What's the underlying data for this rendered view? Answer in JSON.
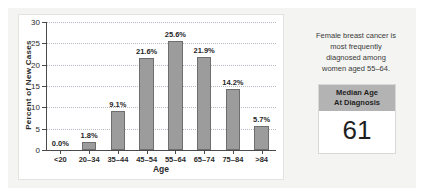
{
  "chart_data": {
    "type": "bar",
    "title": "",
    "xlabel": "Age",
    "ylabel": "Percent of New Cases",
    "categories": [
      "<20",
      "20–34",
      "35–44",
      "45–54",
      "55–64",
      "65–74",
      "75–84",
      ">84"
    ],
    "values": [
      0.0,
      1.8,
      9.1,
      21.6,
      25.6,
      21.9,
      14.2,
      5.7
    ],
    "value_labels": [
      "0.0%",
      "1.8%",
      "9.1%",
      "21.6%",
      "25.6%",
      "21.9%",
      "14.2%",
      "5.7%"
    ],
    "ylim": [
      0,
      30
    ],
    "yticks": [
      0,
      5,
      10,
      15,
      20,
      25,
      30
    ],
    "ytick_labels": [
      "0",
      "5",
      "10",
      "15",
      "20",
      "25",
      "30"
    ],
    "grid": true,
    "legend": false,
    "bar_color": "#9c9c9c",
    "bar_border_color": "#6e6e6e",
    "grid_color": "#b9b9c4",
    "axis_color": "#4a4a4a"
  },
  "side_panel": {
    "note_lines": [
      "Female breast cancer is",
      "most frequently",
      "diagnosed among",
      "women aged 55–64."
    ],
    "median_box": {
      "header_line1": "Median Age",
      "header_line2": "At Diagnosis",
      "value": "61",
      "header_bg": "#b3b3b3",
      "value_bg": "#ffffff"
    }
  }
}
